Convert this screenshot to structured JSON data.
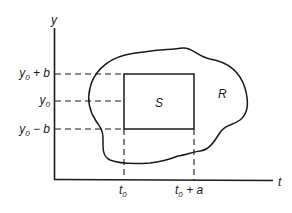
{
  "diagram": {
    "axes": {
      "y_label": "y",
      "x_label": "t"
    },
    "y_ticks": [
      {
        "base": "y",
        "sub": "0",
        "suffix": " + b",
        "y": 73
      },
      {
        "base": "y",
        "sub": "0",
        "suffix": "",
        "y": 101
      },
      {
        "base": "y",
        "sub": "0",
        "suffix": " − b",
        "y": 129
      }
    ],
    "x_ticks": [
      {
        "base": "t",
        "sub": "0",
        "suffix": "",
        "x": 124
      },
      {
        "base": "t",
        "sub": "0",
        "suffix": " + a",
        "x": 194
      }
    ],
    "regions": {
      "inner_label": "S",
      "outer_label": "R"
    },
    "colors": {
      "stroke": "#1a1a1a",
      "background": "#ffffff"
    }
  }
}
